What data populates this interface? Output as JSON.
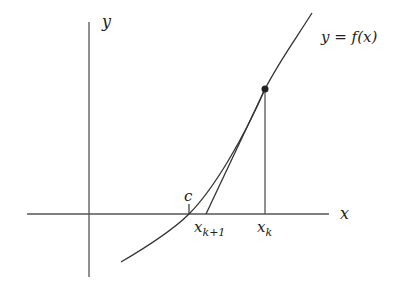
{
  "diagram": {
    "type": "newton-method-illustration",
    "axes": {
      "x_label": "x",
      "y_label": "y"
    },
    "curve": {
      "label": "y = f(x)"
    },
    "points": {
      "root_label": "c",
      "x_k_label": "x",
      "x_k_sub": "k",
      "x_k1_label": "x",
      "x_k1_sub": "k+1"
    },
    "colors": {
      "line": "#333333",
      "axis": "#555555",
      "point": "#222222"
    }
  }
}
